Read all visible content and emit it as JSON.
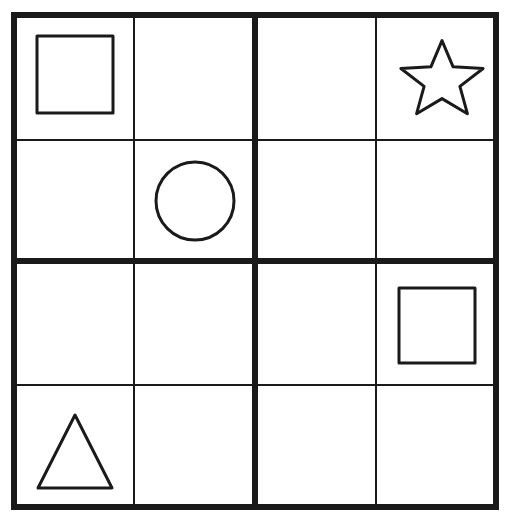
{
  "figure": {
    "type": "shape-grid-puzzle",
    "rows": 4,
    "cols": 4,
    "background_color": "#ffffff",
    "stroke_color": "#1a1a1a",
    "outer_border_width": 6,
    "major_grid_line_width": 6,
    "minor_grid_line_width": 2,
    "shape_stroke_width": 3
  },
  "grid": {
    "left": 14,
    "top": 15,
    "right": 496,
    "bottom": 507,
    "x_lines": [
      14,
      134,
      255,
      376,
      496
    ],
    "y_lines": [
      15,
      140,
      261,
      385,
      507
    ],
    "major_x_line": 255,
    "major_y_line": 261
  },
  "cells": [
    {
      "index": 0,
      "row": 0,
      "col": 1,
      "label": "cell-r1c1",
      "shape": "square",
      "occupied": true
    },
    {
      "index": 1,
      "row": 0,
      "col": 2,
      "label": "cell-r1c2",
      "shape": "",
      "occupied": false
    },
    {
      "index": 2,
      "row": 0,
      "col": 3,
      "label": "cell-r1c3",
      "shape": "",
      "occupied": false
    },
    {
      "index": 3,
      "row": 0,
      "col": 4,
      "label": "cell-r1c4",
      "shape": "star",
      "occupied": true
    },
    {
      "index": 4,
      "row": 1,
      "col": 1,
      "label": "cell-r2c1",
      "shape": "",
      "occupied": false
    },
    {
      "index": 5,
      "row": 1,
      "col": 2,
      "label": "cell-r2c2",
      "shape": "circle",
      "occupied": true
    },
    {
      "index": 6,
      "row": 1,
      "col": 3,
      "label": "cell-r2c3",
      "shape": "",
      "occupied": false
    },
    {
      "index": 7,
      "row": 1,
      "col": 4,
      "label": "cell-r2c4",
      "shape": "",
      "occupied": false
    },
    {
      "index": 8,
      "row": 2,
      "col": 1,
      "label": "cell-r3c1",
      "shape": "",
      "occupied": false
    },
    {
      "index": 9,
      "row": 2,
      "col": 2,
      "label": "cell-r3c2",
      "shape": "",
      "occupied": false
    },
    {
      "index": 10,
      "row": 2,
      "col": 3,
      "label": "cell-r3c3",
      "shape": "",
      "occupied": false
    },
    {
      "index": 11,
      "row": 2,
      "col": 4,
      "label": "cell-r3c4",
      "shape": "square",
      "occupied": true
    },
    {
      "index": 12,
      "row": 3,
      "col": 1,
      "label": "cell-r4c1",
      "shape": "triangle",
      "occupied": true
    },
    {
      "index": 13,
      "row": 3,
      "col": 2,
      "label": "cell-r4c2",
      "shape": "",
      "occupied": false
    },
    {
      "index": 14,
      "row": 3,
      "col": 3,
      "label": "cell-r4c3",
      "shape": "",
      "occupied": false
    },
    {
      "index": 15,
      "row": 3,
      "col": 4,
      "label": "cell-r4c4",
      "shape": "",
      "occupied": false
    }
  ],
  "shapes": [
    {
      "name": "square",
      "row": 0,
      "col": 0,
      "x": 37,
      "y": 36,
      "width": 76,
      "height": 77,
      "stroke": "#1a1a1a",
      "fill": "none"
    },
    {
      "name": "star",
      "row": 0,
      "col": 3,
      "x": 397,
      "y": 39,
      "width": 90,
      "height": 84,
      "points": 5,
      "stroke": "#1a1a1a",
      "fill": "none"
    },
    {
      "name": "circle",
      "row": 1,
      "col": 1,
      "cx": 195,
      "cy": 201,
      "r": 39,
      "stroke": "#1a1a1a",
      "fill": "none"
    },
    {
      "name": "square",
      "row": 2,
      "col": 3,
      "x": 399,
      "y": 288,
      "width": 76,
      "height": 75,
      "stroke": "#1a1a1a",
      "fill": "none"
    },
    {
      "name": "triangle",
      "row": 3,
      "col": 0,
      "x": 38,
      "y": 415,
      "width": 74,
      "height": 73,
      "stroke": "#1a1a1a",
      "fill": "none"
    }
  ]
}
